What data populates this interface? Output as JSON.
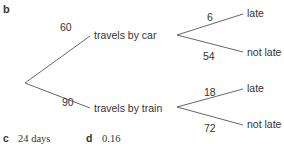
{
  "part_b_label": "b",
  "tree": {
    "first_level": [
      {
        "count": "60",
        "label": "travels by car"
      },
      {
        "count": "90",
        "label": "travels by train"
      }
    ],
    "second_level": {
      "car": [
        {
          "count": "6",
          "label": "late"
        },
        {
          "count": "54",
          "label": "not late"
        }
      ],
      "train": [
        {
          "count": "18",
          "label": "late"
        },
        {
          "count": "72",
          "label": "not late"
        }
      ]
    }
  },
  "answers": {
    "c": {
      "label": "c",
      "value": "24 days"
    },
    "d": {
      "label": "d",
      "value": "0.16"
    }
  }
}
